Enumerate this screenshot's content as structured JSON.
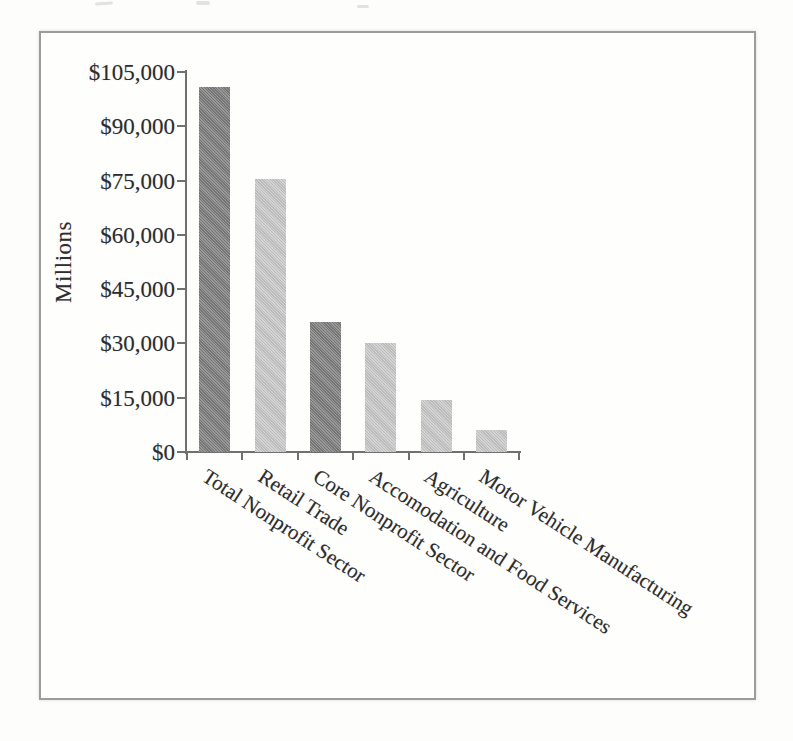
{
  "chart_data": {
    "type": "bar",
    "title": "",
    "ylabel": "Millions",
    "xlabel": "",
    "categories": [
      "Total Nonprofit Sector",
      "Retail Trade",
      "Core Nonprofit Sector",
      "Accomodation and Food Services",
      "Agriculture",
      "Motor Vehicle Manufacturing"
    ],
    "values": [
      101000,
      75500,
      36000,
      30000,
      14400,
      6200
    ],
    "bar_colors": [
      "#7e7e7e",
      "#c9c9c9",
      "#7e7e7e",
      "#c9c9c9",
      "#c9c9c9",
      "#c9c9c9"
    ],
    "ylim": [
      0,
      105000
    ],
    "ytick_values": [
      0,
      15000,
      30000,
      45000,
      60000,
      75000,
      90000,
      105000
    ],
    "ytick_labels": [
      "$0",
      "$15,000",
      "$30,000",
      "$45,000",
      "$60,000",
      "$75,000",
      "$90,000",
      "$105,000"
    ],
    "grid": false,
    "legend": false,
    "xlabel_rotation_deg": -33
  },
  "colors": {
    "frame_border": "#9c9c9c",
    "axis": "#707070",
    "text": "#2d2d2d",
    "paper": "#fdfdfc"
  }
}
